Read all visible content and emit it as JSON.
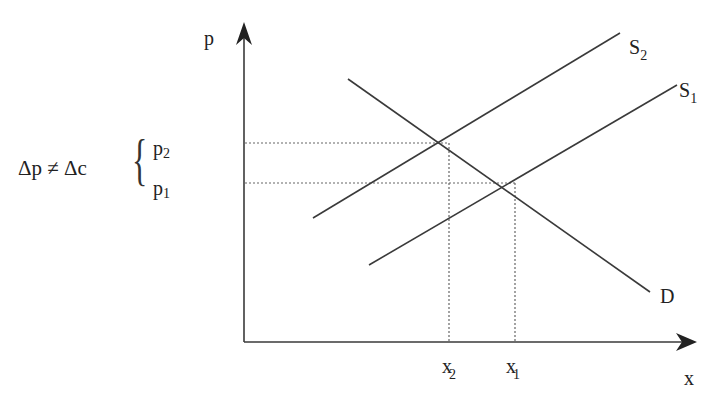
{
  "diagram": {
    "type": "supply-demand",
    "axes": {
      "y_label": "p",
      "x_label": "x"
    },
    "curves": [
      {
        "name": "D",
        "label": "D",
        "subscript": ""
      },
      {
        "name": "S2",
        "label": "S",
        "subscript": "2"
      },
      {
        "name": "S1",
        "label": "S",
        "subscript": "1"
      }
    ],
    "x_ticks": [
      {
        "label": "x",
        "subscript": "2"
      },
      {
        "label": "x",
        "subscript": "1"
      }
    ],
    "price_levels": [
      {
        "label": "p",
        "subscript": "2"
      },
      {
        "label": "p",
        "subscript": "1"
      }
    ],
    "annotation": "Δp ≠  Δc",
    "brace_glyph": "{"
  },
  "colors": {
    "line": "#3a3a3a",
    "dotted": "#555555",
    "background": "#ffffff"
  }
}
